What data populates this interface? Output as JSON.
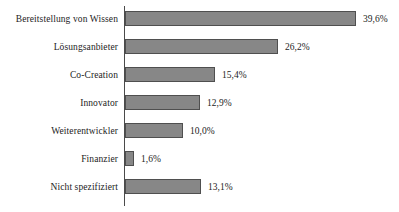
{
  "chart_data": {
    "type": "bar",
    "orientation": "horizontal",
    "title": "",
    "subtitle": "",
    "xlabel": "",
    "ylabel": "",
    "categories": [
      "Bereitstellung von Wissen",
      "Lösungsanbieter",
      "Co-Creation",
      "Innovator",
      "Weiterentwickler",
      "Finanzier",
      "Nicht spezifiziert"
    ],
    "values": [
      39.6,
      26.2,
      15.4,
      12.9,
      10.0,
      1.6,
      13.1
    ],
    "value_labels": [
      "39,6%",
      "26,2%",
      "15,4%",
      "12,9%",
      "10,0%",
      "1,6%",
      "13,1%"
    ],
    "units": "%",
    "xlim": [
      0,
      39.6
    ],
    "grid": false,
    "legend": false,
    "legend_position": "none",
    "bar_color": "#878787",
    "bar_edge_color": "#4f4f4f",
    "axis_color": "#4a4a4a",
    "background_color": "#ffffff",
    "text_color": "#1c1c1c"
  },
  "bars": [
    {
      "label": "Bereitstellung von Wissen",
      "value": 39.6,
      "value_label": "39,6%"
    },
    {
      "label": "Lösungsanbieter",
      "value": 26.2,
      "value_label": "26,2%"
    },
    {
      "label": "Co-Creation",
      "value": 15.4,
      "value_label": "15,4%"
    },
    {
      "label": "Innovator",
      "value": 12.9,
      "value_label": "12,9%"
    },
    {
      "label": "Weiterentwickler",
      "value": 10.0,
      "value_label": "10,0%"
    },
    {
      "label": "Finanzier",
      "value": 1.6,
      "value_label": "1,6%"
    },
    {
      "label": "Nicht spezifiziert",
      "value": 13.1,
      "value_label": "13,1%"
    }
  ]
}
